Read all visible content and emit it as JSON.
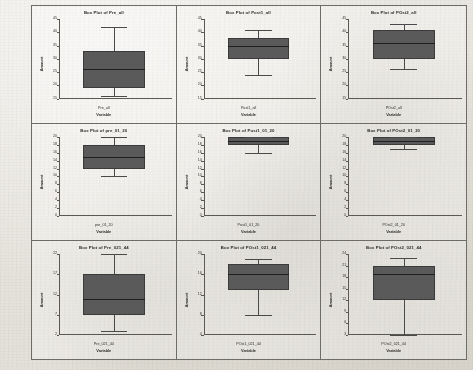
{
  "figure": {
    "layout": {
      "rows": 3,
      "cols": 3
    },
    "y_axis_title": "Amount",
    "x_axis_title": "Variable",
    "box_fill_color": "#5a5a5a",
    "box_edge_color": "#3b3b3b",
    "median_color": "#1f1f1f",
    "page_background": "#e7e4dd"
  },
  "chart_data": [
    {
      "type": "box",
      "title": "Box Plot of Pre_all",
      "xlabel": "Variable",
      "ylabel": "Amount",
      "category": "Pre_all",
      "ylim": [
        15,
        45
      ],
      "yticks": [
        15,
        20,
        25,
        30,
        35,
        40,
        45
      ],
      "grid": false,
      "stats": {
        "whisker_low": 16,
        "q1": 19,
        "median": 26,
        "q3": 33,
        "whisker_high": 42
      }
    },
    {
      "type": "box",
      "title": "Box Plot of Post1_all",
      "xlabel": "Variable",
      "ylabel": "Amount",
      "category": "Post1_all",
      "ylim": [
        15,
        45
      ],
      "yticks": [
        15,
        20,
        25,
        30,
        35,
        40,
        45
      ],
      "grid": false,
      "stats": {
        "whisker_low": 24,
        "q1": 30,
        "median": 35,
        "q3": 38,
        "whisker_high": 41
      }
    },
    {
      "type": "box",
      "title": "Box Plot of POst2_all",
      "xlabel": "Variable",
      "ylabel": "Amount",
      "category": "POst2_all",
      "ylim": [
        15,
        45
      ],
      "yticks": [
        15,
        20,
        25,
        30,
        35,
        40,
        45
      ],
      "grid": false,
      "stats": {
        "whisker_low": 26,
        "q1": 30,
        "median": 36,
        "q3": 41,
        "whisker_high": 43
      }
    },
    {
      "type": "box",
      "title": "Box Plot of pre_01_20",
      "xlabel": "Variable",
      "ylabel": "Amount",
      "category": "pre_01_20",
      "ylim": [
        0,
        20
      ],
      "yticks": [
        0,
        2,
        4,
        6,
        8,
        10,
        12,
        14,
        16,
        18,
        20
      ],
      "grid": false,
      "stats": {
        "whisker_low": 10,
        "q1": 12,
        "median": 15,
        "q3": 18,
        "whisker_high": 20
      }
    },
    {
      "type": "box",
      "title": "Box Plot of Post1_01_20",
      "xlabel": "Variable",
      "ylabel": "Amount",
      "category": "Post1_01_20",
      "ylim": [
        0,
        20
      ],
      "yticks": [
        0,
        2,
        4,
        6,
        8,
        10,
        12,
        14,
        16,
        18,
        20
      ],
      "grid": false,
      "stats": {
        "whisker_low": 16,
        "q1": 18,
        "median": 19,
        "q3": 20,
        "whisker_high": 20
      }
    },
    {
      "type": "box",
      "title": "Box Plot of POst2_01_20",
      "xlabel": "Variable",
      "ylabel": "Amount",
      "category": "POst2_01_20",
      "ylim": [
        0,
        20
      ],
      "yticks": [
        0,
        2,
        4,
        6,
        8,
        10,
        12,
        14,
        16,
        18,
        20
      ],
      "grid": false,
      "stats": {
        "whisker_low": 17,
        "q1": 18,
        "median": 19,
        "q3": 20,
        "whisker_high": 20
      }
    },
    {
      "type": "box",
      "title": "Box Plot of Pre_021_44",
      "xlabel": "Variable",
      "ylabel": "Amount",
      "category": "Pre_021_44",
      "ylim": [
        2,
        22
      ],
      "yticks": [
        2,
        7,
        12,
        17,
        22
      ],
      "grid": false,
      "stats": {
        "whisker_low": 3,
        "q1": 7,
        "median": 11,
        "q3": 17,
        "whisker_high": 22
      }
    },
    {
      "type": "box",
      "title": "Box Plot of POst1_021_44",
      "xlabel": "Variable",
      "ylabel": "Amount",
      "category": "POst1_021_44",
      "ylim": [
        4,
        20
      ],
      "yticks": [
        4,
        8,
        12,
        16,
        20
      ],
      "grid": false,
      "stats": {
        "whisker_low": 8,
        "q1": 13,
        "median": 16,
        "q3": 18,
        "whisker_high": 19
      }
    },
    {
      "type": "box",
      "title": "Box Plot of POst2_021_44",
      "xlabel": "Variable",
      "ylabel": "Amount",
      "category": "POst2_021_44",
      "ylim": [
        3,
        24
      ],
      "yticks": [
        3,
        6,
        9,
        12,
        15,
        18,
        21,
        24
      ],
      "grid": false,
      "stats": {
        "whisker_low": 3,
        "q1": 12,
        "median": 19,
        "q3": 21,
        "whisker_high": 23
      }
    }
  ]
}
